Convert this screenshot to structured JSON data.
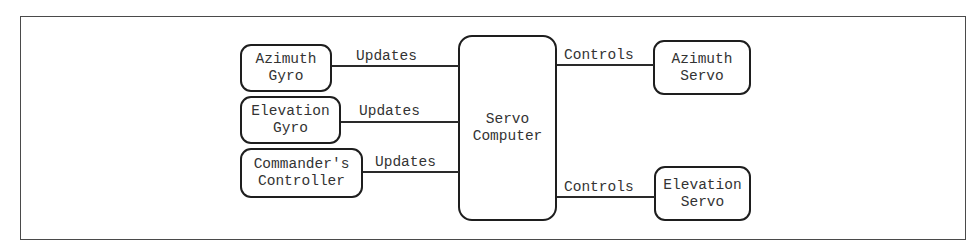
{
  "diagram": {
    "type": "block-diagram",
    "nodes": {
      "azimuth_gyro": {
        "line1": "Azimuth",
        "line2": "Gyro"
      },
      "elevation_gyro": {
        "line1": "Elevation",
        "line2": "Gyro"
      },
      "commanders_controller": {
        "line1": "Commander's",
        "line2": "Controller"
      },
      "servo_computer": {
        "line1": "Servo",
        "line2": "Computer"
      },
      "azimuth_servo": {
        "line1": "Azimuth",
        "line2": "Servo"
      },
      "elevation_servo": {
        "line1": "Elevation",
        "line2": "Servo"
      }
    },
    "edges": [
      {
        "from": "Azimuth Gyro",
        "to": "Servo Computer",
        "label": "Updates"
      },
      {
        "from": "Elevation Gyro",
        "to": "Servo Computer",
        "label": "Updates"
      },
      {
        "from": "Commander's Controller",
        "to": "Servo Computer",
        "label": "Updates"
      },
      {
        "from": "Servo Computer",
        "to": "Azimuth Servo",
        "label": "Controls"
      },
      {
        "from": "Servo Computer",
        "to": "Elevation Servo",
        "label": "Controls"
      }
    ]
  }
}
